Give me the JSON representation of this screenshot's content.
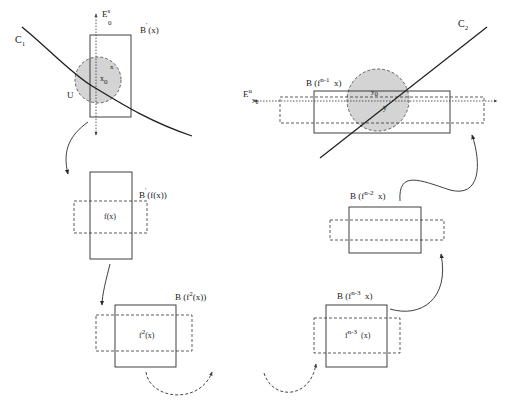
{
  "diagram": {
    "curves": {
      "c1": {
        "label": "C",
        "sub": "1"
      },
      "c2": {
        "label": "C",
        "sub": "2"
      }
    },
    "axes": {
      "stable": {
        "label": "E",
        "sup": "s",
        "sub": "0"
      },
      "unstable": {
        "label": "E",
        "sup": "u",
        "sub": "y",
        "subsub": "0"
      }
    },
    "points": {
      "x0": {
        "label": "x",
        "sub": "0"
      },
      "x": {
        "label": "x"
      },
      "U": {
        "label": "U"
      },
      "y0": {
        "label": "y",
        "sub": "0"
      },
      "y": {
        "label": "y"
      }
    },
    "boxes": [
      {
        "id": "b-x",
        "label": "B (x)",
        "prime": "'",
        "center": ""
      },
      {
        "id": "b-fx",
        "label": "B (f(x))",
        "prime": "'",
        "center": "f(x)"
      },
      {
        "id": "b-f2x",
        "label_pre": "B (f",
        "label_sup": "2",
        "label_post": "(x))",
        "prime": "'",
        "center_pre": "f",
        "center_sup": "2",
        "center_post": "(x)"
      },
      {
        "id": "b-fn3x",
        "label_pre": "B (f",
        "label_sup": "n-3",
        "label_post": "x)",
        "prime": "'",
        "center_pre": "f",
        "center_sup": "n-3",
        "center_post": "(x)"
      },
      {
        "id": "b-fn2x",
        "label_pre": "B (f",
        "label_sup": "n-2",
        "label_post": "x)",
        "prime": "'"
      },
      {
        "id": "b-fn1x",
        "label_pre": "B (f",
        "label_sup": "n-1",
        "label_post": "x)",
        "prime": "'"
      }
    ],
    "colors": {
      "line": "#2a2a2a",
      "neighborhood_fill": "#d4d4d4",
      "neighborhood_stroke": "#555555"
    }
  }
}
